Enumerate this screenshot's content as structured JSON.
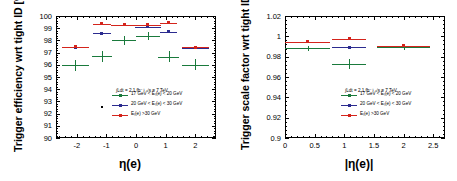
{
  "figure": {
    "panels": [
      {
        "id": "left",
        "ylabel": "Trigger efficiency wrt tight ID [%]",
        "xlabel": "η(e)",
        "yticks": [
          "100",
          "99",
          "98",
          "97",
          "96",
          "95",
          "94",
          "93",
          "92",
          "91",
          "90"
        ],
        "xticks": [
          "-2",
          "-1",
          "0",
          "1",
          "2"
        ],
        "ylim": [
          90,
          100
        ],
        "xlim": [
          -2.7,
          2.7
        ]
      },
      {
        "id": "right",
        "ylabel": "Trigger scale factor wrt tight ID",
        "xlabel": "|η(e)|",
        "yticks": [
          "1.02",
          "1",
          "0.98",
          "0.96",
          "0.94",
          "0.92",
          "0.9"
        ],
        "xticks": [
          "0",
          "0.5",
          "1",
          "1.5",
          "2",
          "2.5"
        ],
        "ylim": [
          0.9,
          1.02
        ],
        "xlim": [
          0,
          2.7
        ]
      }
    ],
    "legend": {
      "lumi": "∫Ldt = 2.1 fb⁻¹ √s = 7 TeV",
      "entries": [
        {
          "label": "17 GeV < Eₜ(e) < 20 GeV",
          "color": "#1a7a3c"
        },
        {
          "label": "20 GeV < Eₜ(e) < 30 GeV",
          "color": "#2b2b8f"
        },
        {
          "label": "Eₜ(e) >30 GeV",
          "color": "#d4241c"
        }
      ]
    },
    "colors": {
      "green": "#1a7a3c",
      "blue": "#2b2b8f",
      "red": "#d4241c",
      "axis": "#000000"
    }
  },
  "chart_data": [
    {
      "type": "scatter",
      "title": "",
      "panel": "left",
      "xlabel": "η(e)",
      "ylabel": "Trigger efficiency wrt tight ID [%]",
      "xlim": [
        -2.7,
        2.7
      ],
      "ylim": [
        90,
        100
      ],
      "grid": false,
      "legend_position": "lower-right",
      "series": [
        {
          "name": "17 GeV < E_T(e) < 20 GeV",
          "color": "#1a7a3c",
          "marker": "cross",
          "points": [
            {
              "x": -2.05,
              "y": 95.95,
              "xerr": 0.45,
              "yerr": 0.45
            },
            {
              "x": -1.15,
              "y": 96.7,
              "xerr": 0.35,
              "yerr": 0.45
            },
            {
              "x": -0.4,
              "y": 98.0,
              "xerr": 0.4,
              "yerr": 0.35
            },
            {
              "x": 0.4,
              "y": 98.35,
              "xerr": 0.4,
              "yerr": 0.3
            },
            {
              "x": 1.1,
              "y": 96.65,
              "xerr": 0.35,
              "yerr": 0.45
            },
            {
              "x": 2.0,
              "y": 96.0,
              "xerr": 0.45,
              "yerr": 0.45
            }
          ]
        },
        {
          "name": "20 GeV < E_T(e) < 30 GeV",
          "color": "#2b2b8f",
          "marker": "square",
          "points": [
            {
              "x": -2.05,
              "y": 97.45,
              "xerr": 0.45,
              "yerr": 0.12
            },
            {
              "x": -1.15,
              "y": 98.6,
              "xerr": 0.3,
              "yerr": 0.12
            },
            {
              "x": -0.4,
              "y": 99.3,
              "xerr": 0.45,
              "yerr": 0.1
            },
            {
              "x": 0.4,
              "y": 99.1,
              "xerr": 0.45,
              "yerr": 0.1
            },
            {
              "x": 1.1,
              "y": 98.7,
              "xerr": 0.3,
              "yerr": 0.12
            },
            {
              "x": 2.0,
              "y": 97.4,
              "xerr": 0.45,
              "yerr": 0.12
            }
          ]
        },
        {
          "name": "E_T(e) >30 GeV",
          "color": "#d4241c",
          "marker": "square",
          "points": [
            {
              "x": -2.05,
              "y": 97.5,
              "xerr": 0.45,
              "yerr": 0.1
            },
            {
              "x": -1.15,
              "y": 99.35,
              "xerr": 0.3,
              "yerr": 0.1
            },
            {
              "x": -0.4,
              "y": 99.3,
              "xerr": 0.45,
              "yerr": 0.08
            },
            {
              "x": 0.4,
              "y": 99.3,
              "xerr": 0.45,
              "yerr": 0.08
            },
            {
              "x": 1.1,
              "y": 99.45,
              "xerr": 0.3,
              "yerr": 0.1
            },
            {
              "x": 2.0,
              "y": 97.45,
              "xerr": 0.45,
              "yerr": 0.1
            }
          ]
        }
      ]
    },
    {
      "type": "scatter",
      "title": "",
      "panel": "right",
      "xlabel": "|η(e)|",
      "ylabel": "Trigger scale factor wrt tight ID",
      "xlim": [
        0,
        2.7
      ],
      "ylim": [
        0.9,
        1.02
      ],
      "grid": false,
      "legend_position": "lower-right",
      "series": [
        {
          "name": "17 GeV < E_T(e) < 20 GeV",
          "color": "#1a7a3c",
          "marker": "cross",
          "points": [
            {
              "x": 0.38,
              "y": 0.9885,
              "xerr": 0.38,
              "yerr": 0.0022
            },
            {
              "x": 1.08,
              "y": 0.9725,
              "xerr": 0.28,
              "yerr": 0.0048
            },
            {
              "x": 2.0,
              "y": 0.9892,
              "xerr": 0.45,
              "yerr": 0.003
            }
          ]
        },
        {
          "name": "20 GeV < E_T(e) < 30 GeV",
          "color": "#2b2b8f",
          "marker": "square",
          "points": [
            {
              "x": 0.38,
              "y": 0.9945,
              "xerr": 0.38,
              "yerr": 0.0012
            },
            {
              "x": 1.08,
              "y": 0.9892,
              "xerr": 0.28,
              "yerr": 0.0014
            },
            {
              "x": 2.0,
              "y": 0.9905,
              "xerr": 0.45,
              "yerr": 0.0014
            }
          ]
        },
        {
          "name": "E_T(e) >30 GeV",
          "color": "#d4241c",
          "marker": "square",
          "points": [
            {
              "x": 0.38,
              "y": 0.9948,
              "xerr": 0.38,
              "yerr": 0.001
            },
            {
              "x": 1.08,
              "y": 0.9975,
              "xerr": 0.28,
              "yerr": 0.001
            },
            {
              "x": 2.0,
              "y": 0.9905,
              "xerr": 0.45,
              "yerr": 0.0012
            }
          ]
        }
      ]
    }
  ]
}
